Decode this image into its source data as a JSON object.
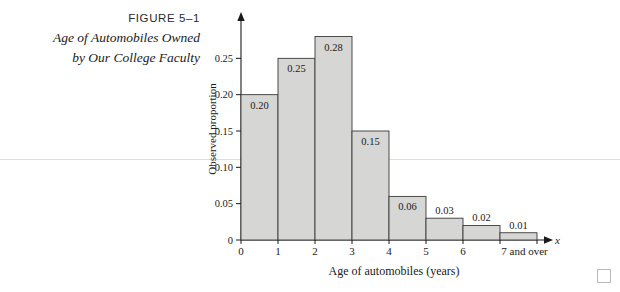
{
  "caption": {
    "figure_number": "FIGURE 5–1",
    "title_line1": "Age of Automobiles Owned",
    "title_line2": "by Our College Faculty"
  },
  "chart_data": {
    "type": "bar",
    "title": "",
    "xlabel": "Age of automobiles (years)",
    "ylabel": "Observed proportion",
    "x_variable_symbol": "x",
    "categories": [
      "0",
      "1",
      "2",
      "3",
      "4",
      "5",
      "6",
      "7 and over"
    ],
    "values": [
      0.2,
      0.25,
      0.28,
      0.15,
      0.06,
      0.03,
      0.02,
      0.01
    ],
    "value_labels": [
      "0.20",
      "0.25",
      "0.28",
      "0.15",
      "0.06",
      "0.03",
      "0.02",
      "0.01"
    ],
    "ylim": [
      0,
      0.3
    ],
    "yticks": [
      0,
      0.05,
      0.1,
      0.15,
      0.2,
      0.25
    ],
    "ytick_labels": [
      "0",
      "0.05",
      "0.10",
      "0.15",
      "0.20",
      "0.25"
    ],
    "grid": false,
    "legend": null,
    "bar_fill_color": "#d6d6d4",
    "bar_edge_color": "#3a3a3a"
  }
}
